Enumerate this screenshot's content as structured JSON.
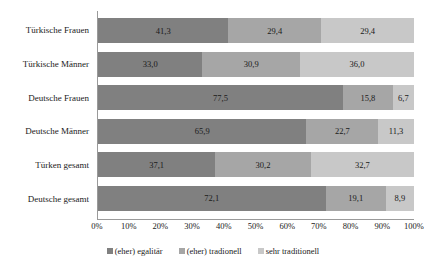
{
  "chart_data": {
    "type": "bar",
    "orientation": "horizontal",
    "stacked": true,
    "stack_mode": "percent",
    "title": "",
    "subtitle": "",
    "xlabel": "",
    "ylabel": "",
    "xlim": [
      0,
      100
    ],
    "grid": false,
    "legend_position": "bottom",
    "categories": [
      "Türkische Frauen",
      "Türkische Männer",
      "Deutsche Frauen",
      "Deutsche Männer",
      "Türken gesamt",
      "Deutsche gesamt"
    ],
    "series": [
      {
        "name": "(eher) egalitär",
        "color": "#808080",
        "values": [
          41.3,
          33.0,
          77.5,
          65.9,
          37.1,
          72.1
        ],
        "labels": [
          "41,3",
          "33,0",
          "77,5",
          "65,9",
          "37,1",
          "72,1"
        ]
      },
      {
        "name": "(eher) tradionell",
        "color": "#a6a6a6",
        "values": [
          29.4,
          30.9,
          15.8,
          22.7,
          30.2,
          19.1
        ],
        "labels": [
          "29,4",
          "30,9",
          "15,8",
          "22,7",
          "30,2",
          "19,1"
        ]
      },
      {
        "name": "sehr traditionell",
        "color": "#c8c8c8",
        "values": [
          29.4,
          36.0,
          6.7,
          11.3,
          32.7,
          8.9
        ],
        "labels": [
          "29,4",
          "36,0",
          "6,7",
          "11,3",
          "32,7",
          "8,9"
        ]
      }
    ],
    "xticks": [
      {
        "value": 0,
        "label": "0%"
      },
      {
        "value": 10,
        "label": "10%"
      },
      {
        "value": 20,
        "label": "20%"
      },
      {
        "value": 30,
        "label": "30%"
      },
      {
        "value": 40,
        "label": "40%"
      },
      {
        "value": 50,
        "label": "50%"
      },
      {
        "value": 60,
        "label": "60%"
      },
      {
        "value": 70,
        "label": "70%"
      },
      {
        "value": 80,
        "label": "80%"
      },
      {
        "value": 90,
        "label": "90%"
      },
      {
        "value": 100,
        "label": "100%"
      }
    ]
  },
  "legend": {
    "items": [
      {
        "label": "(eher) egalitär",
        "color": "#808080"
      },
      {
        "label": "(eher) tradionell",
        "color": "#a6a6a6"
      },
      {
        "label": "sehr traditionell",
        "color": "#c8c8c8"
      }
    ]
  },
  "colors": {
    "segment_egalitaer": "#808080",
    "segment_tradionell": "#a6a6a6",
    "segment_sehr_traditionell": "#c8c8c8",
    "axis_line": "#9a9a9a",
    "background": "#ffffff",
    "text": "#1a1a1a"
  }
}
